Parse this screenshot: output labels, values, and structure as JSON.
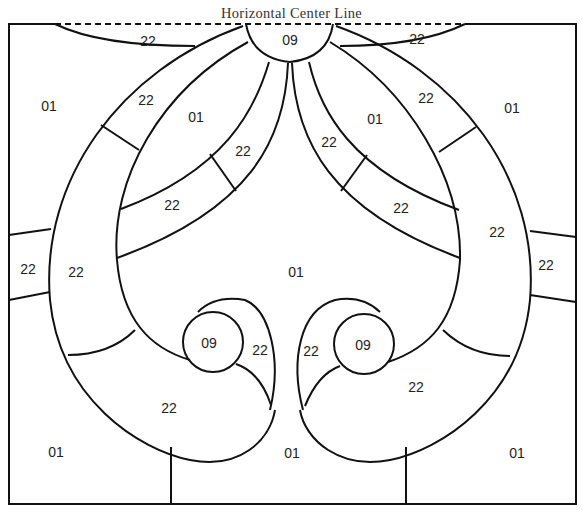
{
  "title": "Horizontal Center Line",
  "colors": {
    "line": "#111111",
    "background": "#ffffff"
  },
  "regions": [
    {
      "code": "22",
      "x": 148,
      "y": 41
    },
    {
      "code": "09",
      "x": 290,
      "y": 40
    },
    {
      "code": "22",
      "x": 417,
      "y": 39
    },
    {
      "code": "01",
      "x": 49,
      "y": 106
    },
    {
      "code": "22",
      "x": 146,
      "y": 100
    },
    {
      "code": "01",
      "x": 196,
      "y": 117
    },
    {
      "code": "22",
      "x": 243,
      "y": 151
    },
    {
      "code": "22",
      "x": 172,
      "y": 205
    },
    {
      "code": "01",
      "x": 375,
      "y": 119
    },
    {
      "code": "22",
      "x": 426,
      "y": 98
    },
    {
      "code": "22",
      "x": 329,
      "y": 142
    },
    {
      "code": "01",
      "x": 512,
      "y": 108
    },
    {
      "code": "22",
      "x": 401,
      "y": 208
    },
    {
      "code": "22",
      "x": 497,
      "y": 232
    },
    {
      "code": "22",
      "x": 28,
      "y": 269
    },
    {
      "code": "22",
      "x": 76,
      "y": 272
    },
    {
      "code": "01",
      "x": 296,
      "y": 272
    },
    {
      "code": "22",
      "x": 546,
      "y": 265
    },
    {
      "code": "09",
      "x": 209,
      "y": 343
    },
    {
      "code": "22",
      "x": 260,
      "y": 350
    },
    {
      "code": "22",
      "x": 311,
      "y": 351
    },
    {
      "code": "09",
      "x": 363,
      "y": 345
    },
    {
      "code": "22",
      "x": 416,
      "y": 387
    },
    {
      "code": "22",
      "x": 169,
      "y": 408
    },
    {
      "code": "01",
      "x": 56,
      "y": 452
    },
    {
      "code": "01",
      "x": 292,
      "y": 453
    },
    {
      "code": "01",
      "x": 517,
      "y": 453
    }
  ]
}
